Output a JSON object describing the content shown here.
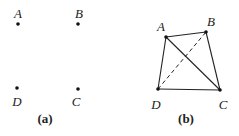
{
  "figures": [
    {
      "caption": "(a)",
      "points": [
        {
          "label": "A",
          "x": 18,
          "y": 24,
          "lx": 18,
          "ly": 18
        },
        {
          "label": "B",
          "x": 78,
          "y": 24,
          "lx": 79,
          "ly": 18
        },
        {
          "label": "D",
          "x": 17,
          "y": 88,
          "lx": 17,
          "ly": 106
        },
        {
          "label": "C",
          "x": 78,
          "y": 89,
          "lx": 76,
          "ly": 106
        }
      ]
    },
    {
      "caption": "(b)",
      "points": [
        {
          "label": "A",
          "x": 166,
          "y": 37,
          "lx": 161,
          "ly": 31
        },
        {
          "label": "B",
          "x": 206,
          "y": 32,
          "lx": 211,
          "ly": 26
        },
        {
          "label": "D",
          "x": 158,
          "y": 89,
          "lx": 156,
          "ly": 109
        },
        {
          "label": "C",
          "x": 220,
          "y": 90,
          "lx": 223,
          "ly": 109
        }
      ],
      "solid_edges": [
        [
          "A",
          "B"
        ],
        [
          "B",
          "C"
        ],
        [
          "C",
          "D"
        ],
        [
          "D",
          "A"
        ],
        [
          "A",
          "C"
        ]
      ],
      "dashed_edges": [
        [
          "D",
          "B"
        ]
      ]
    }
  ]
}
